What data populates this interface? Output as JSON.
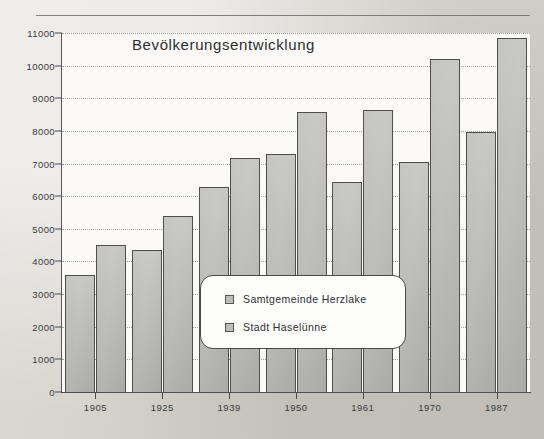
{
  "chart_data": {
    "type": "bar",
    "title": "Bevölkerungsentwicklung",
    "xlabel": "",
    "ylabel": "",
    "categories": [
      "1905",
      "1925",
      "1939",
      "1950",
      "1961",
      "1970",
      "1987"
    ],
    "series": [
      {
        "name": "Samtgemeinde Herzlake",
        "color": "#bcbcba",
        "values": [
          3570,
          4350,
          6280,
          7290,
          6430,
          7060,
          7980
        ]
      },
      {
        "name": "Stadt Haselünne",
        "color": "#bcbcba",
        "values": [
          4500,
          5400,
          7170,
          8580,
          8650,
          10200,
          10850
        ]
      }
    ],
    "ylim": [
      0,
      11000
    ],
    "yticks": [
      0,
      1000,
      2000,
      3000,
      4000,
      5000,
      6000,
      7000,
      8000,
      9000,
      10000,
      11000
    ],
    "ytick_labels": [
      "0",
      "1000",
      "2000",
      "3000",
      "4000",
      "5000",
      "6000",
      "7000",
      "8000",
      "9000",
      "10000",
      "11000"
    ],
    "grid": true,
    "grid_style": "dotted",
    "legend_position": "center",
    "legend_entries": [
      "Samtgemeinde Herzlake",
      "Stadt Haselünne"
    ]
  },
  "figure": {
    "background_color": "#d6d3cd",
    "plot_background_color": "#fbfaf8",
    "axis_color": "#4f4f4f",
    "bar_edge_color": "#4e4e4e",
    "text_color": "#2f2f2f"
  }
}
